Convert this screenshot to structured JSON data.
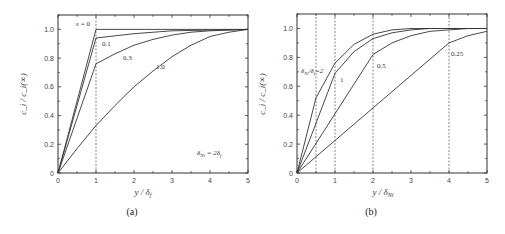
{
  "chart_data": [
    {
      "panel": "(a)",
      "type": "line",
      "title": "",
      "xlabel": "y / δ_f",
      "ylabel": "c_i / c_i(∞)",
      "xlim": [
        0,
        5
      ],
      "ylim": [
        0,
        1.1
      ],
      "xticks": [
        "0",
        "1",
        "2",
        "3",
        "4",
        "5"
      ],
      "yticks": [
        "0",
        "0.2",
        "0.4",
        "0.6",
        "0.8",
        "1.0"
      ],
      "grid": false,
      "vlines": [
        1
      ],
      "annotation": "δ_Ni = 2δ_f",
      "series": [
        {
          "name": "ε = 0",
          "label": "ε = 0",
          "x": [
            0,
            1,
            5
          ],
          "y": [
            0,
            1.0,
            1.0
          ]
        },
        {
          "name": "0.1",
          "label": "0.1",
          "x": [
            0,
            1,
            2,
            3,
            4,
            5
          ],
          "y": [
            0,
            0.94,
            0.97,
            0.99,
            0.995,
            1.0
          ]
        },
        {
          "name": "0.3",
          "label": "0.3",
          "x": [
            0,
            1,
            1.5,
            2,
            2.5,
            3,
            3.5,
            4,
            5
          ],
          "y": [
            0,
            0.76,
            0.83,
            0.89,
            0.93,
            0.96,
            0.98,
            0.99,
            1.0
          ]
        },
        {
          "name": "1.0",
          "label": "1.0",
          "x": [
            0,
            0.5,
            1,
            1.5,
            2,
            2.5,
            3,
            3.5,
            4,
            4.5,
            5
          ],
          "y": [
            0,
            0.17,
            0.33,
            0.47,
            0.6,
            0.71,
            0.81,
            0.89,
            0.95,
            0.98,
            1.0
          ]
        }
      ]
    },
    {
      "panel": "(b)",
      "type": "line",
      "title": "",
      "xlabel": "y / δ_Ni",
      "ylabel": "c_i / c_i(∞)",
      "xlim": [
        0,
        5
      ],
      "ylim": [
        0,
        1.1
      ],
      "xticks": [
        "0",
        "1",
        "2",
        "3",
        "4",
        "5"
      ],
      "yticks": [
        "0",
        "0.2",
        "0.4",
        "0.6",
        "0.8",
        "1.0"
      ],
      "grid": false,
      "vlines": [
        0.5,
        1,
        2,
        4
      ],
      "series": [
        {
          "name": "δ_Ni/δ_f = 2",
          "label": "δ_Ni / δ_f = 2",
          "x": [
            0,
            0.5,
            1,
            1.5,
            2,
            2.5,
            3,
            4,
            5
          ],
          "y": [
            0,
            0.52,
            0.76,
            0.89,
            0.96,
            0.99,
            1.0,
            1.0,
            1.0
          ]
        },
        {
          "name": "1",
          "label": "1",
          "x": [
            0,
            1,
            1.5,
            2,
            2.5,
            3,
            3.5,
            4,
            5
          ],
          "y": [
            0,
            0.69,
            0.84,
            0.93,
            0.97,
            0.99,
            1.0,
            1.0,
            1.0
          ]
        },
        {
          "name": "0.5",
          "label": "0.5",
          "x": [
            0,
            2,
            2.5,
            3,
            3.5,
            4,
            4.5,
            5
          ],
          "y": [
            0,
            0.82,
            0.9,
            0.95,
            0.98,
            0.99,
            1.0,
            1.0
          ]
        },
        {
          "name": "0.25",
          "label": "0.25",
          "x": [
            0,
            4,
            4.5,
            5
          ],
          "y": [
            0,
            0.9,
            0.95,
            0.98
          ]
        }
      ]
    }
  ],
  "panels": {
    "a": {
      "label": "(a)",
      "xlabel_main": "y / δ",
      "xlabel_sub": "f",
      "ylabel": "c_i / c_i(∞)",
      "annotation_main": "δ",
      "annotation_sub": "Ni",
      "annotation_rest": " = 2δ",
      "annotation_sub2": "f",
      "curve_labels": [
        "ε = 0",
        "0.1",
        "0.3",
        "1.0"
      ]
    },
    "b": {
      "label": "(b)",
      "xlabel_main": "y / δ",
      "xlabel_sub": "Ni",
      "ylabel": "c_i / c_i(∞)",
      "curve_labels": [
        "δNi/δf=2",
        "1",
        "0.5",
        "0.25"
      ]
    }
  },
  "ticks": {
    "x": [
      "0",
      "1",
      "2",
      "3",
      "4",
      "5"
    ],
    "y": [
      "0",
      "0.2",
      "0.4",
      "0.6",
      "0.8",
      "1.0"
    ]
  }
}
